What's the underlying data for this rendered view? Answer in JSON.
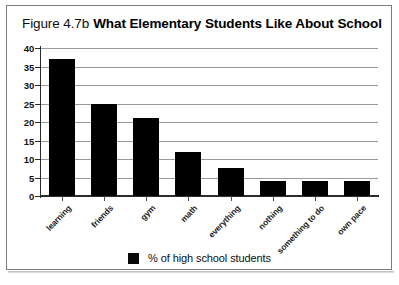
{
  "figure": {
    "label": "Figure 4.7b",
    "title": "What Elementary Students Like About School",
    "frame_color": "#7e7e7e",
    "background": "#ffffff"
  },
  "legend": {
    "position": "bottom-center",
    "swatch_color": "#000000",
    "label": "% of high school students"
  },
  "axis": {
    "y_ticks": [
      "0",
      "5",
      "10",
      "15",
      "20",
      "25",
      "30",
      "35",
      "40"
    ],
    "x_categories": [
      "learning",
      "friends",
      "gym",
      "math",
      "everything",
      "nothing",
      "something to do",
      "own pace"
    ]
  },
  "chart_data": {
    "type": "bar",
    "title": "What Elementary Students Like About School",
    "subtitle": "Figure 4.7b",
    "categories": [
      "learning",
      "friends",
      "gym",
      "math",
      "everything",
      "nothing",
      "something to do",
      "own pace"
    ],
    "values": [
      37,
      25,
      21,
      12,
      7.5,
      4,
      4,
      4
    ],
    "series": [
      {
        "name": "% of high school students",
        "values": [
          37,
          25,
          21,
          12,
          7.5,
          4,
          4,
          4
        ],
        "color": "#000000"
      }
    ],
    "xlabel": "",
    "ylabel": "",
    "ylim": [
      0,
      40
    ],
    "ytick_interval": 5,
    "yticks": [
      0,
      5,
      10,
      15,
      20,
      25,
      30,
      35,
      40
    ],
    "grid": true,
    "grid_axis": "y",
    "legend": "bottom-center",
    "bar_color": "#000000",
    "xtick_label_rotation": -46
  }
}
